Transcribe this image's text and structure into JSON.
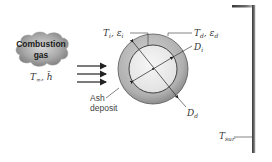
{
  "diagram": {
    "source": {
      "label_line1": "Combustion",
      "label_line2": "gas",
      "props_T": "T",
      "props_T_sub": "∞",
      "props_h": "h̄"
    },
    "tube_inner": {
      "T": "T",
      "T_sub": "i",
      "eps": "ε",
      "eps_sub": "i",
      "D": "D",
      "D_sub": "i"
    },
    "deposit": {
      "T": "T",
      "T_sub": "d",
      "eps": "ε",
      "eps_sub": "d",
      "D": "D",
      "D_sub": "d",
      "label_line1": "Ash",
      "label_line2": "deposit"
    },
    "surroundings": {
      "T": "T",
      "T_sub": "sur"
    },
    "flow_arrows": 3,
    "colors": {
      "cloud": "#8a8a8a",
      "deposit_ring": "#b4b4b4",
      "tube_interior": "#ececec",
      "wall": "#555555",
      "lines": "#333333"
    }
  }
}
